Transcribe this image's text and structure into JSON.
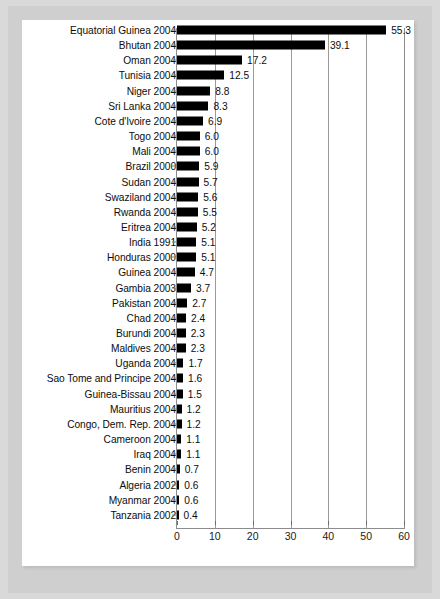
{
  "chart_data": {
    "type": "bar",
    "orientation": "horizontal",
    "title": "",
    "subtitle": "",
    "xlabel": "",
    "ylabel": "",
    "xlim": [
      0,
      60
    ],
    "xticks": [
      0,
      10,
      20,
      30,
      40,
      50,
      60
    ],
    "xtick_labels": [
      "0",
      "10",
      "20",
      "30",
      "40",
      "50",
      "60"
    ],
    "grid": true,
    "grid_axis": "x",
    "legend": null,
    "bar_color": "#000000",
    "categories": [
      "Equatorial Guinea 2004",
      "Bhutan 2004",
      "Oman 2004",
      "Tunisia 2004",
      "Niger 2004",
      "Sri Lanka 2004",
      "Cote d'Ivoire 2004",
      "Togo 2004",
      "Mali 2004",
      "Brazil 2000",
      "Sudan 2004",
      "Swaziland 2004",
      "Rwanda 2004",
      "Eritrea 2004",
      "India 1991",
      "Honduras 2000",
      "Guinea 2004",
      "Gambia 2003",
      "Pakistan 2004",
      "Chad 2004",
      "Burundi 2004",
      "Maldives 2004",
      "Uganda 2004",
      "Sao Tome and Principe 2004",
      "Guinea-Bissau 2004",
      "Mauritius 2004",
      "Congo, Dem. Rep. 2004",
      "Cameroon 2004",
      "Iraq 2004",
      "Benin 2004",
      "Algeria 2002",
      "Myanmar 2004",
      "Tanzania 2002"
    ],
    "values": [
      55.3,
      39.1,
      17.2,
      12.5,
      8.8,
      8.3,
      6.9,
      6.0,
      6.0,
      5.9,
      5.7,
      5.6,
      5.5,
      5.2,
      5.1,
      5.1,
      4.7,
      3.7,
      2.7,
      2.4,
      2.3,
      2.3,
      1.7,
      1.6,
      1.5,
      1.2,
      1.2,
      1.1,
      1.1,
      0.7,
      0.6,
      0.6,
      0.4
    ],
    "value_labels": [
      "55.3",
      "39.1",
      "17.2",
      "12.5",
      "8.8",
      "8.3",
      "6.9",
      "6.0",
      "6.0",
      "5.9",
      "5.7",
      "5.6",
      "5.5",
      "5.2",
      "5.1",
      "5.1",
      "4.7",
      "3.7",
      "2.7",
      "2.4",
      "2.3",
      "2.3",
      "1.7",
      "1.6",
      "1.5",
      "1.2",
      "1.2",
      "1.1",
      "1.1",
      "0.7",
      "0.6",
      "0.6",
      "0.4"
    ]
  }
}
